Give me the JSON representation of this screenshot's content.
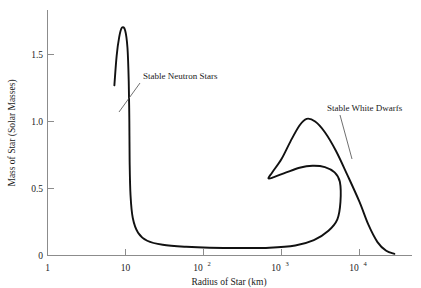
{
  "chart_data": {
    "type": "line",
    "title": "",
    "xlabel": "Radius of Star (km)",
    "ylabel": "Mass of Star (Solar Masses)",
    "x_scale": "log",
    "y_scale": "linear",
    "xlim": [
      1,
      40000
    ],
    "ylim": [
      0,
      1.8
    ],
    "grid": false,
    "legend": "none",
    "x_ticks": [
      {
        "value": 1,
        "label": "1",
        "mantissa": "1",
        "exponent": ""
      },
      {
        "value": 10,
        "label": "10",
        "mantissa": "10",
        "exponent": ""
      },
      {
        "value": 100,
        "label": "10^2",
        "mantissa": "10",
        "exponent": "2"
      },
      {
        "value": 1000,
        "label": "10^3",
        "mantissa": "10",
        "exponent": "3"
      },
      {
        "value": 10000,
        "label": "10^4",
        "mantissa": "10",
        "exponent": "4"
      }
    ],
    "y_ticks": [
      {
        "value": 0,
        "label": "0"
      },
      {
        "value": 0.5,
        "label": "0.5"
      },
      {
        "value": 1.0,
        "label": "1.0"
      },
      {
        "value": 1.5,
        "label": "1.5"
      }
    ],
    "annotations": [
      {
        "name": "stable-neutron-stars",
        "text": "Stable Neutron Stars",
        "text_x": 143,
        "text_y": 79,
        "leader_from_x": 140,
        "leader_from_y": 83,
        "leader_to_x": 119,
        "leader_to_y": 112
      },
      {
        "name": "stable-white-dwarfs",
        "text": "Stable White Dwarfs",
        "text_x": 327,
        "text_y": 111,
        "leader_from_x": 340,
        "leader_from_y": 115,
        "leader_to_x": 352,
        "leader_to_y": 159
      }
    ],
    "series": [
      {
        "name": "mass-radius-relation",
        "description": "Equilibrium mass-radius curve for cold degenerate stars, spanning the stable neutron star branch at small radii and the stable white dwarf branch at large radii.",
        "color": "#111111",
        "points": [
          {
            "radius_km": 7.2,
            "mass_solar": 1.27
          },
          {
            "radius_km": 7.7,
            "mass_solar": 1.49
          },
          {
            "radius_km": 8.3,
            "mass_solar": 1.63
          },
          {
            "radius_km": 9.0,
            "mass_solar": 1.7
          },
          {
            "radius_km": 9.9,
            "mass_solar": 1.68
          },
          {
            "radius_km": 10.6,
            "mass_solar": 1.55
          },
          {
            "radius_km": 11.0,
            "mass_solar": 1.3
          },
          {
            "radius_km": 11.2,
            "mass_solar": 1.0
          },
          {
            "radius_km": 11.3,
            "mass_solar": 0.7
          },
          {
            "radius_km": 11.6,
            "mass_solar": 0.45
          },
          {
            "radius_km": 12.4,
            "mass_solar": 0.28
          },
          {
            "radius_km": 14.5,
            "mass_solar": 0.17
          },
          {
            "radius_km": 19.0,
            "mass_solar": 0.11
          },
          {
            "radius_km": 30.0,
            "mass_solar": 0.08
          },
          {
            "radius_km": 60.0,
            "mass_solar": 0.065
          },
          {
            "radius_km": 120.0,
            "mass_solar": 0.058
          },
          {
            "radius_km": 300.0,
            "mass_solar": 0.056
          },
          {
            "radius_km": 700.0,
            "mass_solar": 0.058
          },
          {
            "radius_km": 1500.0,
            "mass_solar": 0.075
          },
          {
            "radius_km": 2600.0,
            "mass_solar": 0.115
          },
          {
            "radius_km": 4000.0,
            "mass_solar": 0.185
          },
          {
            "radius_km": 5200.0,
            "mass_solar": 0.27
          },
          {
            "radius_km": 5700.0,
            "mass_solar": 0.4
          },
          {
            "radius_km": 5600.0,
            "mass_solar": 0.55
          },
          {
            "radius_km": 4800.0,
            "mass_solar": 0.62
          },
          {
            "radius_km": 3600.0,
            "mass_solar": 0.66
          },
          {
            "radius_km": 2500.0,
            "mass_solar": 0.67
          },
          {
            "radius_km": 1700.0,
            "mass_solar": 0.655
          },
          {
            "radius_km": 1150.0,
            "mass_solar": 0.62
          },
          {
            "radius_km": 800.0,
            "mass_solar": 0.585
          },
          {
            "radius_km": 680.0,
            "mass_solar": 0.575
          },
          {
            "radius_km": 760.0,
            "mass_solar": 0.62
          },
          {
            "radius_km": 1000.0,
            "mass_solar": 0.72
          },
          {
            "radius_km": 1300.0,
            "mass_solar": 0.85
          },
          {
            "radius_km": 1700.0,
            "mass_solar": 0.97
          },
          {
            "radius_km": 2100.0,
            "mass_solar": 1.02
          },
          {
            "radius_km": 2700.0,
            "mass_solar": 1.0
          },
          {
            "radius_km": 3600.0,
            "mass_solar": 0.92
          },
          {
            "radius_km": 5000.0,
            "mass_solar": 0.78
          },
          {
            "radius_km": 7000.0,
            "mass_solar": 0.6
          },
          {
            "radius_km": 10000.0,
            "mass_solar": 0.4
          },
          {
            "radius_km": 13000.0,
            "mass_solar": 0.23
          },
          {
            "radius_km": 17000.0,
            "mass_solar": 0.1
          },
          {
            "radius_km": 22000.0,
            "mass_solar": 0.035
          },
          {
            "radius_km": 28000.0,
            "mass_solar": 0.012
          }
        ]
      }
    ]
  }
}
